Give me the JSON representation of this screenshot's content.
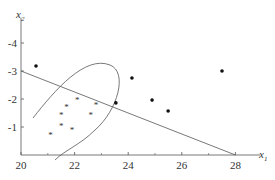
{
  "chart_data": {
    "type": "scatter",
    "title": "",
    "xlabel": "x1",
    "ylabel": "x2",
    "xlim": [
      20,
      29
    ],
    "ylim": [
      0,
      4.8
    ],
    "x_ticks": [
      "20",
      "22",
      "24",
      "26",
      "28"
    ],
    "y_ticks": [
      "-1",
      "-2",
      "-3",
      "-4"
    ],
    "grid": false,
    "series": [
      {
        "name": "class-asterisk",
        "marker": "*",
        "points": [
          [
            21.1,
            0.75
          ],
          [
            21.5,
            1.05
          ],
          [
            21.5,
            1.45
          ],
          [
            21.7,
            1.75
          ],
          [
            21.9,
            0.9
          ],
          [
            22.1,
            2.0
          ],
          [
            22.6,
            1.45
          ],
          [
            22.8,
            1.8
          ]
        ]
      },
      {
        "name": "class-dot",
        "marker": "dot",
        "points": [
          [
            20.56,
            3.18
          ],
          [
            23.54,
            1.86
          ],
          [
            24.14,
            2.75
          ],
          [
            24.89,
            1.96
          ],
          [
            25.49,
            1.57
          ],
          [
            27.5,
            3.0
          ]
        ]
      }
    ],
    "annotations": [
      {
        "type": "line",
        "from": [
          20,
          3.0
        ],
        "to": [
          28,
          0
        ]
      },
      {
        "type": "ellipse-boundary",
        "description": "tilted ellipse enclosing asterisk points"
      }
    ]
  },
  "labels": {
    "x_axis": "x",
    "x_sub": "1",
    "y_axis": "x",
    "y_sub": "2"
  }
}
